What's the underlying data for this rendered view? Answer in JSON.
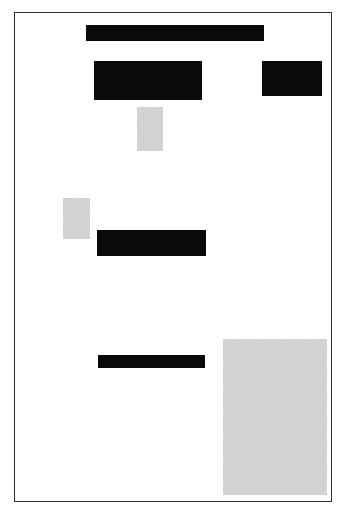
{
  "page": {
    "border_color": "#333333",
    "background": "#ffffff"
  },
  "blocks": [
    {
      "id": "redaction-title",
      "type": "redaction",
      "color": "#0a0a0a",
      "x": 86,
      "y": 25,
      "w": 178,
      "h": 16
    },
    {
      "id": "redaction-block-left",
      "type": "redaction",
      "color": "#0a0a0a",
      "x": 94,
      "y": 61,
      "w": 108,
      "h": 39
    },
    {
      "id": "redaction-block-right",
      "type": "redaction",
      "color": "#0a0a0a",
      "x": 262,
      "y": 61,
      "w": 60,
      "h": 35
    },
    {
      "id": "image-placeholder-1",
      "type": "halftone",
      "color": "#d9d9d9",
      "x": 137,
      "y": 107,
      "w": 26,
      "h": 44
    },
    {
      "id": "image-placeholder-2",
      "type": "halftone",
      "color": "#d9d9d9",
      "x": 63,
      "y": 198,
      "w": 27,
      "h": 41
    },
    {
      "id": "redaction-middle",
      "type": "redaction",
      "color": "#0a0a0a",
      "x": 97,
      "y": 230,
      "w": 109,
      "h": 26
    },
    {
      "id": "redaction-lower",
      "type": "redaction",
      "color": "#0a0a0a",
      "x": 98,
      "y": 355,
      "w": 107,
      "h": 13
    },
    {
      "id": "image-placeholder-3",
      "type": "halftone",
      "color": "#d9d9d9",
      "x": 223,
      "y": 339,
      "w": 104,
      "h": 156
    }
  ]
}
